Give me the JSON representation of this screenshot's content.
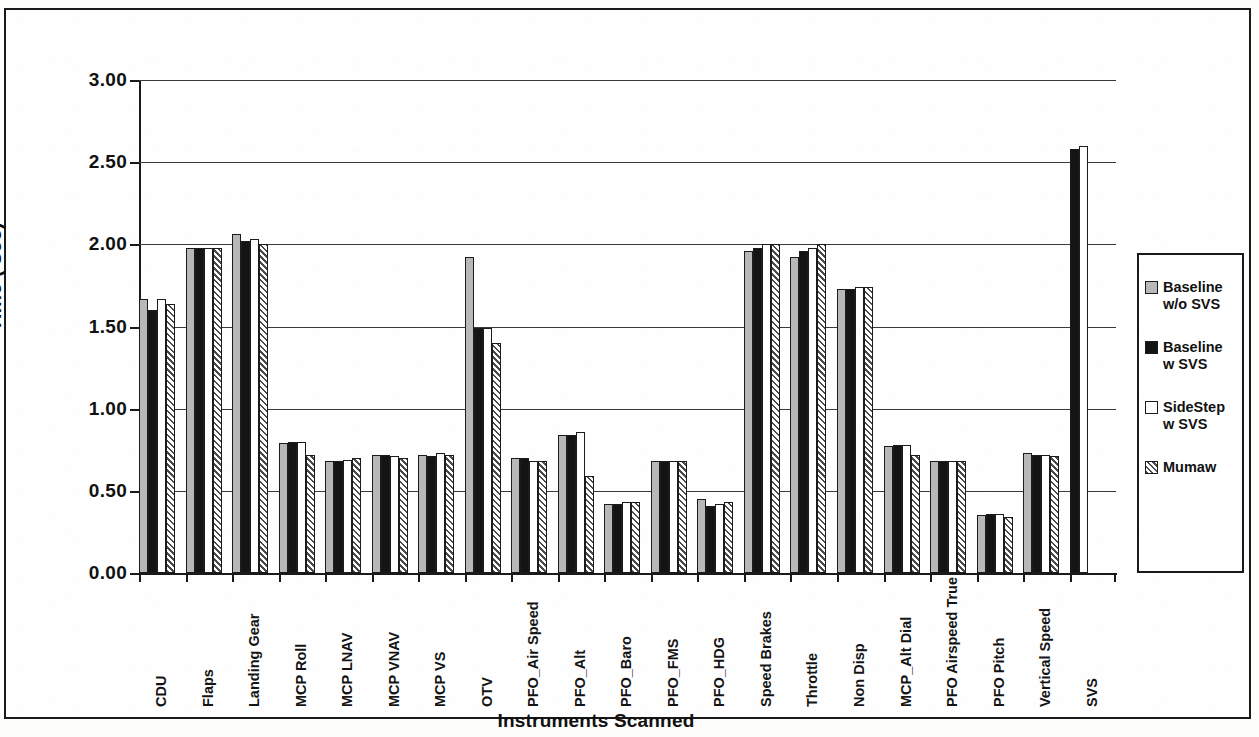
{
  "chart_data": {
    "type": "bar",
    "title": "",
    "xlabel": "Instruments Scanned",
    "ylabel": "Time ( sec)",
    "ylim": [
      0.0,
      3.0
    ],
    "yticks": [
      "0.00",
      "0.50",
      "1.00",
      "1.50",
      "2.00",
      "2.50",
      "3.00"
    ],
    "ytick_values": [
      0.0,
      0.5,
      1.0,
      1.5,
      2.0,
      2.5,
      3.0
    ],
    "grid": true,
    "legend_position": "right-outside",
    "categories": [
      "CDU",
      "Flaps",
      "Landing Gear",
      "MCP Roll",
      "MCP LNAV",
      "MCP VNAV",
      "MCP VS",
      "OTV",
      "PFO_Air Speed",
      "PFO_Alt",
      "PFO_Baro",
      "PFO_FMS",
      "PFO_HDG",
      "Speed Brakes",
      "Throttle",
      "Non Disp",
      "MCP_Alt Dial",
      "PFO Airspeed True",
      "PFO Pitch",
      "Vertical Speed",
      "SVS"
    ],
    "series": [
      {
        "name": "Baseline w/o SVS",
        "color": "#b8b8b8",
        "pattern": "solid-gray",
        "values": [
          1.67,
          1.98,
          2.06,
          0.79,
          0.68,
          0.72,
          0.72,
          1.92,
          0.7,
          0.84,
          0.42,
          0.68,
          0.45,
          1.96,
          1.92,
          1.73,
          0.77,
          0.68,
          0.35,
          0.73,
          0.0
        ]
      },
      {
        "name": "Baseline w SVS",
        "color": "#141414",
        "pattern": "solid-black",
        "values": [
          1.6,
          1.98,
          2.02,
          0.8,
          0.68,
          0.72,
          0.71,
          1.49,
          0.7,
          0.84,
          0.42,
          0.68,
          0.41,
          1.98,
          1.96,
          1.73,
          0.78,
          0.68,
          0.36,
          0.72,
          2.58
        ]
      },
      {
        "name": "SideStep w SVS",
        "color": "#ffffff",
        "pattern": "solid-white",
        "values": [
          1.67,
          1.98,
          2.03,
          0.8,
          0.69,
          0.71,
          0.73,
          1.49,
          0.68,
          0.86,
          0.43,
          0.68,
          0.42,
          2.0,
          1.98,
          1.74,
          0.78,
          0.68,
          0.36,
          0.72,
          2.6
        ]
      },
      {
        "name": "Mumaw",
        "color": "#4a4a4a",
        "pattern": "diagonal-hatch",
        "values": [
          1.64,
          1.98,
          2.0,
          0.72,
          0.7,
          0.7,
          0.72,
          1.4,
          0.68,
          0.59,
          0.43,
          0.68,
          0.43,
          2.0,
          2.0,
          1.74,
          0.72,
          0.68,
          0.34,
          0.71,
          0.0
        ]
      }
    ]
  },
  "legend": {
    "items": [
      {
        "label": "Baseline\nw/o SVS",
        "swatch": "s0"
      },
      {
        "label": "Baseline\nw SVS",
        "swatch": "s1"
      },
      {
        "label": "SideStep\nw SVS",
        "swatch": "s2"
      },
      {
        "label": "Mumaw",
        "swatch": "s3"
      }
    ]
  }
}
